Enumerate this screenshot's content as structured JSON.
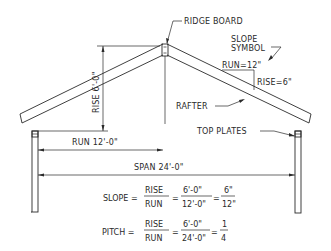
{
  "diagram": {
    "labels": {
      "ridge_board": "RIDGE BOARD",
      "slope_symbol_line1": "SLOPE",
      "slope_symbol_line2": "SYMBOL",
      "slope_symbol_run": "RUN=12\"",
      "slope_symbol_rise": "RISE=6\"",
      "rafter": "RAFTER",
      "top_plates": "TOP PLATES",
      "rise_dimension": "RISE 6'-0\"",
      "run_dimension": "RUN 12'-0\"",
      "span_dimension": "SPAN 24'-0\""
    },
    "formulas": {
      "slope": {
        "label": "SLOPE =",
        "num1": "RISE",
        "den1": "RUN",
        "eq1": "=",
        "num2": "6'-0\"",
        "den2": "12'-0\"",
        "eq2": "=",
        "num3": "6\"",
        "den3": "12\""
      },
      "pitch": {
        "label": "PITCH =",
        "num1": "RISE",
        "den1": "RUN",
        "eq1": "=",
        "num2": "6'-0\"",
        "den2": "24'-0\"",
        "eq2": "=",
        "num3": "1",
        "den3": "4"
      }
    },
    "values": {
      "rise": "6'-0\"",
      "run": "12'-0\"",
      "span": "24'-0\"",
      "slope": "6/12",
      "pitch": "1/4"
    },
    "colors": {
      "line": "#2a2a2a",
      "background": "#ffffff"
    }
  }
}
